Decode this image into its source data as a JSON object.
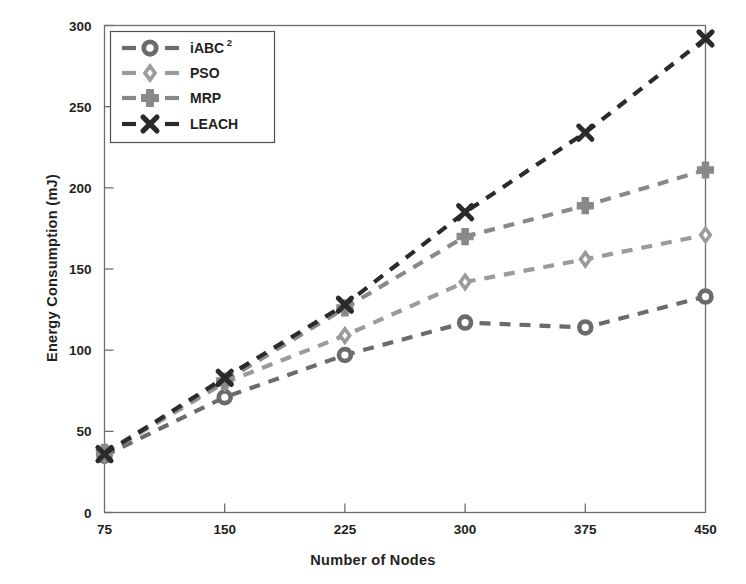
{
  "chart_data": {
    "type": "line",
    "title": "",
    "xlabel": "Number of Nodes",
    "ylabel": "Energy Consumption (mJ)",
    "x": [
      75,
      150,
      225,
      300,
      375,
      450
    ],
    "xticklabels": [
      "75",
      "150",
      "225",
      "300",
      "375",
      "450"
    ],
    "yticklabels": [
      "0",
      "50",
      "100",
      "150",
      "200",
      "250",
      "300"
    ],
    "yticks": [
      0,
      50,
      100,
      150,
      200,
      250,
      300
    ],
    "xlim": [
      75,
      450
    ],
    "ylim": [
      0,
      300
    ],
    "grid": false,
    "legend_position": "upper-left-inside",
    "linestyle": "dashed",
    "series": [
      {
        "name": "iABC²",
        "label": "iABC",
        "superscript": "2",
        "marker": "circle",
        "color": "#6b6b6b",
        "values": [
          35,
          71,
          97,
          117,
          114,
          133
        ]
      },
      {
        "name": "PSO",
        "label": "PSO",
        "superscript": "",
        "marker": "diamond",
        "color": "#9b9b9b",
        "values": [
          36,
          80,
          109,
          142,
          156,
          171
        ]
      },
      {
        "name": "MRP",
        "label": "MRP",
        "superscript": "",
        "marker": "plus-filled",
        "color": "#898989",
        "values": [
          37,
          81,
          126,
          170,
          189,
          211
        ]
      },
      {
        "name": "LEACH",
        "label": "LEACH",
        "superscript": "",
        "marker": "x-bold",
        "color": "#2b2b2b",
        "values": [
          36,
          83,
          128,
          185,
          234,
          292
        ]
      }
    ]
  },
  "axes": {
    "frame_color": "#6e6e6e",
    "background": "#ffffff"
  }
}
